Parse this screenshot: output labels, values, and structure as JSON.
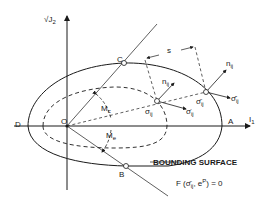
{
  "diagram": {
    "type": "bounding-surface-plasticity",
    "axes": {
      "vertical_label": "√J",
      "vertical_sub": "2",
      "horizontal_label": "I",
      "horizontal_sub": "1"
    },
    "points": {
      "origin": "O",
      "A": "A",
      "B": "B",
      "C": "C",
      "D": "D"
    },
    "angles": {
      "Mc": "M",
      "Mc_sub": "c",
      "Me": "M",
      "Me_sub": "e"
    },
    "vectors": {
      "n_inner": "n",
      "n_inner_sub": "ij",
      "n_outer": "n",
      "n_outer_sub": "ij",
      "sigma_inner": "σ",
      "sigma_inner_sub": "ij",
      "sigma_dot": "σ̇",
      "sigma_dot_sub": "ij",
      "sigma_bar": "σ̄",
      "sigma_bar_sub": "ij",
      "sigma_bar_dot": "σ̄̇",
      "sigma_bar_dot_sub": "ij"
    },
    "distance_label": "s",
    "caption": "BOUNDING SURFACE",
    "equation": {
      "prefix": "F (",
      "sigma": "σ̄",
      "sigma_sub": "ij",
      "sep": ", e",
      "sup": "P",
      "suffix": ") = 0"
    },
    "colors": {
      "ink": "#1a1a1a",
      "background": "#ffffff"
    }
  }
}
